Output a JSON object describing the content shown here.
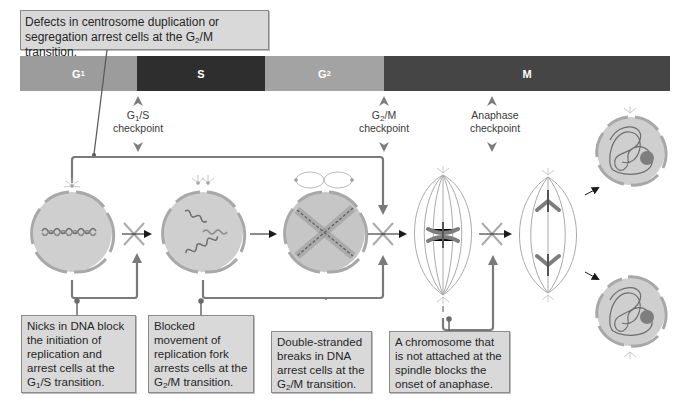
{
  "top_callout": {
    "line1": "Defects in centrosome duplication or",
    "line2_pre": "segregation arrest cells at the G",
    "line2_sub": "2",
    "line2_post": "/M transition."
  },
  "phases": [
    {
      "label": "G",
      "sub": "1",
      "color": "#9c9c9c"
    },
    {
      "label": "S",
      "sub": "",
      "color": "#2e2e2e"
    },
    {
      "label": "G",
      "sub": "2",
      "color": "#a3a3a3"
    },
    {
      "label": "M",
      "sub": "",
      "color": "#454545"
    }
  ],
  "checkpoints": [
    {
      "name_pre": "G",
      "name_sub": "1",
      "name_post": "/S",
      "line2": "checkpoint"
    },
    {
      "name_pre": "G",
      "name_sub": "2",
      "name_post": "/M",
      "line2": "checkpoint"
    },
    {
      "name_pre": "Anaphase",
      "name_sub": "",
      "name_post": "",
      "line2": "checkpoint"
    }
  ],
  "bottom_callouts": [
    {
      "lines": [
        "Nicks in DNA block",
        "the initiation of",
        "replication and",
        "arrest cells at the"
      ],
      "last_pre": "G",
      "last_sub": "1",
      "last_post": "/S transition."
    },
    {
      "lines": [
        "Blocked",
        "movement of",
        "replication fork",
        "arrests cells at the"
      ],
      "last_pre": "G",
      "last_sub": "2",
      "last_post": "/M transition."
    },
    {
      "lines": [
        "Double-stranded",
        "breaks in DNA",
        "arrest cells at the"
      ],
      "last_pre": "G",
      "last_sub": "2",
      "last_post": "/M transition."
    },
    {
      "lines": [
        "A chromosome that",
        "is not attached at the",
        "spindle blocks the",
        "onset of anaphase."
      ],
      "last_pre": "",
      "last_sub": "",
      "last_post": ""
    }
  ],
  "colors": {
    "cell_fill": "#cfcfcf",
    "membrane": "#a8a8a8",
    "connector": "#7a7a7a",
    "callout_bg": "#d9d9d9",
    "dna": "#6e6e6e"
  }
}
